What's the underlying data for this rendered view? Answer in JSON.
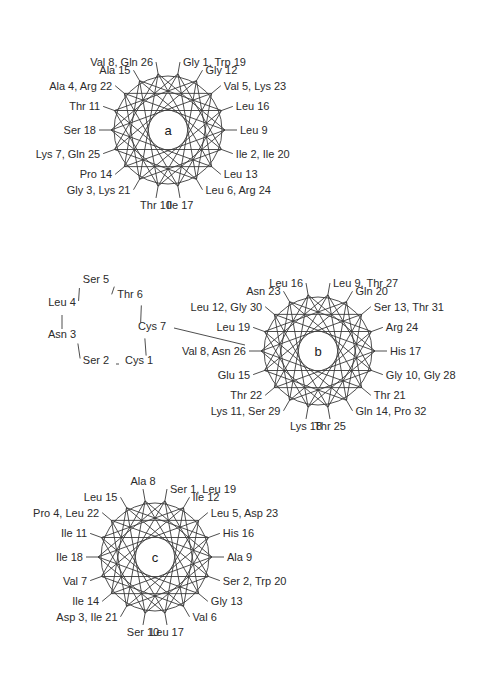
{
  "figure": {
    "background": "#ffffff",
    "line_color": "#3a3a3a",
    "text_color": "#2b2b2b"
  },
  "chart_data": {
    "type": "diagram",
    "diagram_type": "helical-wheel",
    "title": "",
    "residues_per_turn": 3.6,
    "angle_per_residue_deg": 100,
    "panels": [
      {
        "id": "a",
        "center_letter": "a",
        "center": [
          168,
          130
        ],
        "radius": 57,
        "positions": 18,
        "labels": [
          {
            "pos": 0,
            "text": "Gly 1, Trp 19",
            "anchor": "start"
          },
          {
            "pos": 1,
            "text": "Gly 12",
            "anchor": "start"
          },
          {
            "pos": 2,
            "text": "Val 5, Lys 23",
            "anchor": "start"
          },
          {
            "pos": 3,
            "text": "Leu 16",
            "anchor": "start"
          },
          {
            "pos": 4,
            "text": "Leu 9",
            "anchor": "start"
          },
          {
            "pos": 5,
            "text": "Ile 2, Ile 20",
            "anchor": "start"
          },
          {
            "pos": 6,
            "text": "Leu 13",
            "anchor": "start"
          },
          {
            "pos": 7,
            "text": "Leu 6, Arg 24",
            "anchor": "start"
          },
          {
            "pos": 8,
            "text": "Ile 17",
            "anchor": "middle"
          },
          {
            "pos": 9,
            "text": "Thr 10",
            "anchor": "middle"
          },
          {
            "pos": 10,
            "text": "Gly 3, Lys 21",
            "anchor": "end"
          },
          {
            "pos": 11,
            "text": "Pro 14",
            "anchor": "end"
          },
          {
            "pos": 12,
            "text": "Lys 7, Gln 25",
            "anchor": "end"
          },
          {
            "pos": 13,
            "text": "Ser 18",
            "anchor": "end"
          },
          {
            "pos": 14,
            "text": "Thr 11",
            "anchor": "end"
          },
          {
            "pos": 15,
            "text": "Ala 4, Arg 22",
            "anchor": "end"
          },
          {
            "pos": 16,
            "text": "Ala 15",
            "anchor": "end"
          },
          {
            "pos": 17,
            "text": "Val 8, Gln 26",
            "anchor": "end"
          }
        ]
      },
      {
        "id": "b",
        "center_letter": "b",
        "center": [
          318,
          351
        ],
        "radius": 57,
        "positions": 18,
        "labels": [
          {
            "pos": 0,
            "text": "Leu 9, Thr 27",
            "anchor": "start"
          },
          {
            "pos": 1,
            "text": "Gln 20",
            "anchor": "start"
          },
          {
            "pos": 2,
            "text": "Ser 13, Thr 31",
            "anchor": "start"
          },
          {
            "pos": 3,
            "text": "Arg 24",
            "anchor": "start"
          },
          {
            "pos": 4,
            "text": "His 17",
            "anchor": "start"
          },
          {
            "pos": 5,
            "text": "Gly 10, Gly 28",
            "anchor": "start"
          },
          {
            "pos": 6,
            "text": "Thr 21",
            "anchor": "start"
          },
          {
            "pos": 7,
            "text": "Gln 14, Pro 32",
            "anchor": "start"
          },
          {
            "pos": 8,
            "text": "Thr 25",
            "anchor": "middle"
          },
          {
            "pos": 9,
            "text": "Lys 18",
            "anchor": "middle"
          },
          {
            "pos": 10,
            "text": "Lys 11, Ser 29",
            "anchor": "end"
          },
          {
            "pos": 11,
            "text": "Thr 22",
            "anchor": "end"
          },
          {
            "pos": 12,
            "text": "Glu 15",
            "anchor": "end"
          },
          {
            "pos": 13,
            "text": "Val 8, Asn 26",
            "anchor": "end"
          },
          {
            "pos": 14,
            "text": "Leu 19",
            "anchor": "end"
          },
          {
            "pos": 15,
            "text": "Leu 12, Gly 30",
            "anchor": "end"
          },
          {
            "pos": 16,
            "text": "Asn 23",
            "anchor": "end"
          },
          {
            "pos": 17,
            "text": "Leu 16",
            "anchor": "end"
          }
        ]
      },
      {
        "id": "c",
        "center_letter": "c",
        "center": [
          155,
          557
        ],
        "radius": 57,
        "positions": 18,
        "labels": [
          {
            "pos": 0,
            "text": "Ser 1, Leu 19",
            "anchor": "start"
          },
          {
            "pos": 1,
            "text": "Ile 12",
            "anchor": "start"
          },
          {
            "pos": 2,
            "text": "Leu 5, Asp 23",
            "anchor": "start"
          },
          {
            "pos": 3,
            "text": "His 16",
            "anchor": "start"
          },
          {
            "pos": 4,
            "text": "Ala 9",
            "anchor": "start"
          },
          {
            "pos": 5,
            "text": "Ser 2, Trp 20",
            "anchor": "start"
          },
          {
            "pos": 6,
            "text": "Gly 13",
            "anchor": "start"
          },
          {
            "pos": 7,
            "text": "Val 6",
            "anchor": "start"
          },
          {
            "pos": 8,
            "text": "Leu 17",
            "anchor": "middle"
          },
          {
            "pos": 9,
            "text": "Ser 10",
            "anchor": "middle"
          },
          {
            "pos": 10,
            "text": "Asp 3, Ile 21",
            "anchor": "end"
          },
          {
            "pos": 11,
            "text": "Ile 14",
            "anchor": "end"
          },
          {
            "pos": 12,
            "text": "Val 7",
            "anchor": "end"
          },
          {
            "pos": 13,
            "text": "Ile 18",
            "anchor": "end"
          },
          {
            "pos": 14,
            "text": "Ile 11",
            "anchor": "end"
          },
          {
            "pos": 15,
            "text": "Pro 4, Leu 22",
            "anchor": "end"
          },
          {
            "pos": 16,
            "text": "Leu 15",
            "anchor": "end"
          },
          {
            "pos": 17,
            "text": "Ala 8",
            "anchor": "middle"
          }
        ]
      }
    ],
    "loop_diagram": {
      "id": "cyclic-loop",
      "description": "Cyclic peptide loop Cys1-Ser2-Asn3-Leu4-Ser5-Thr6-Cys7 connected to wheel b",
      "nodes": [
        {
          "text": "Ser 5",
          "x": 96,
          "y": 283,
          "anchor": "middle"
        },
        {
          "text": "Thr 6",
          "x": 130,
          "y": 298,
          "anchor": "middle"
        },
        {
          "text": "Leu 4",
          "x": 62,
          "y": 306,
          "anchor": "middle"
        },
        {
          "text": "Cys 7",
          "x": 152,
          "y": 330,
          "anchor": "middle"
        },
        {
          "text": "Asn 3",
          "x": 62,
          "y": 338,
          "anchor": "middle"
        },
        {
          "text": "Ser 2",
          "x": 96,
          "y": 364,
          "anchor": "middle"
        },
        {
          "text": "Cys 1",
          "x": 139,
          "y": 364,
          "anchor": "middle"
        }
      ],
      "edges": [
        [
          0,
          1
        ],
        [
          0,
          2
        ],
        [
          1,
          3
        ],
        [
          2,
          4
        ],
        [
          4,
          5
        ],
        [
          5,
          6
        ],
        [
          6,
          3
        ]
      ],
      "tether_to_wheel": true
    }
  }
}
